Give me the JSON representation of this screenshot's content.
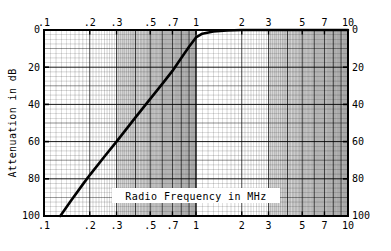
{
  "chart_data": {
    "type": "line",
    "title": "",
    "xlabel": "Radio Frequency in MHz",
    "ylabel": "Attenuation in dB",
    "xscale": "log",
    "yscale": "linear",
    "xlim": [
      0.1,
      10
    ],
    "ylim": [
      100,
      0
    ],
    "grid": true,
    "grid_style": "log-log graph paper, major and minor rules",
    "legend": "none",
    "x_ticks": [
      {
        "value": 0.1,
        "label": ".1"
      },
      {
        "value": 0.2,
        "label": ".2"
      },
      {
        "value": 0.3,
        "label": ".3"
      },
      {
        "value": 0.5,
        "label": ".5"
      },
      {
        "value": 0.7,
        "label": ".7"
      },
      {
        "value": 1,
        "label": "1"
      },
      {
        "value": 2,
        "label": "2"
      },
      {
        "value": 3,
        "label": "3"
      },
      {
        "value": 5,
        "label": "5"
      },
      {
        "value": 7,
        "label": "7"
      },
      {
        "value": 10,
        "label": "10"
      }
    ],
    "y_ticks": [
      {
        "value": 0,
        "label": "0"
      },
      {
        "value": 20,
        "label": "20"
      },
      {
        "value": 40,
        "label": "40"
      },
      {
        "value": 60,
        "label": "60"
      },
      {
        "value": 80,
        "label": "80"
      },
      {
        "value": 100,
        "label": "100"
      }
    ],
    "series": [
      {
        "name": "Attenuation",
        "color": "#000000",
        "linewidth": 2.6,
        "points": [
          {
            "x": 0.128,
            "y": 100
          },
          {
            "x": 0.15,
            "y": 92
          },
          {
            "x": 0.18,
            "y": 83
          },
          {
            "x": 0.2,
            "y": 78
          },
          {
            "x": 0.25,
            "y": 68
          },
          {
            "x": 0.3,
            "y": 60
          },
          {
            "x": 0.35,
            "y": 53
          },
          {
            "x": 0.4,
            "y": 47
          },
          {
            "x": 0.5,
            "y": 37
          },
          {
            "x": 0.6,
            "y": 29
          },
          {
            "x": 0.7,
            "y": 22
          },
          {
            "x": 0.8,
            "y": 15
          },
          {
            "x": 0.9,
            "y": 9
          },
          {
            "x": 1.0,
            "y": 4
          },
          {
            "x": 1.1,
            "y": 2
          },
          {
            "x": 1.3,
            "y": 0.8
          },
          {
            "x": 1.6,
            "y": 0.3
          },
          {
            "x": 2.0,
            "y": 0
          },
          {
            "x": 3.0,
            "y": 0
          },
          {
            "x": 5.0,
            "y": 0
          },
          {
            "x": 10.0,
            "y": 0
          }
        ]
      }
    ],
    "shaded_bands": [
      {
        "from": 0.3,
        "to": 1.0,
        "note": "grey tinted band"
      },
      {
        "from": 3.0,
        "to": 10.0,
        "note": "grey tinted band"
      }
    ]
  },
  "axes": {
    "left_title": "Attenuation in dB",
    "bottom_title": "Radio Frequency in MHz",
    "top_corner_left": "0",
    "top_corner_right": "0",
    "bottom_corner_left": "100",
    "bottom_corner_right": "100",
    "bottom_left_decade": ".1",
    "bottom_right_decade": "10"
  }
}
